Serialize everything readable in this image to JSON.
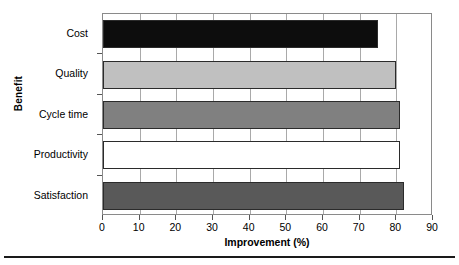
{
  "chart_data": {
    "type": "bar",
    "orientation": "horizontal",
    "title": "",
    "xlabel": "Improvement (%)",
    "ylabel": "Benefit",
    "categories": [
      "Cost",
      "Quality",
      "Cycle time",
      "Productivity",
      "Satisfaction"
    ],
    "values": [
      75,
      80,
      81,
      81,
      82
    ],
    "series": [
      {
        "name": "Improvement (%)",
        "values": [
          75,
          80,
          81,
          81,
          82
        ]
      }
    ],
    "bar_colors": [
      "#0d0d0d",
      "#c0c0c0",
      "#808080",
      "#ffffff",
      "#595959"
    ],
    "bar_edge_color": "#2b2b2b",
    "xlim": [
      0,
      90
    ],
    "xticks": [
      0,
      10,
      20,
      30,
      40,
      50,
      60,
      70,
      80,
      90
    ],
    "xtick_labels": [
      "0",
      "10",
      "20",
      "30",
      "40",
      "50",
      "60",
      "70",
      "80",
      "90"
    ],
    "grid": {
      "vertical": true,
      "horizontal": false,
      "color": "#a9a9a9"
    },
    "legend": {
      "visible": false,
      "position": "none"
    },
    "axis_frame_color": "#8a8a8a",
    "background": "#ffffff"
  },
  "footer": {
    "rule_color": "#1a1a1a"
  }
}
